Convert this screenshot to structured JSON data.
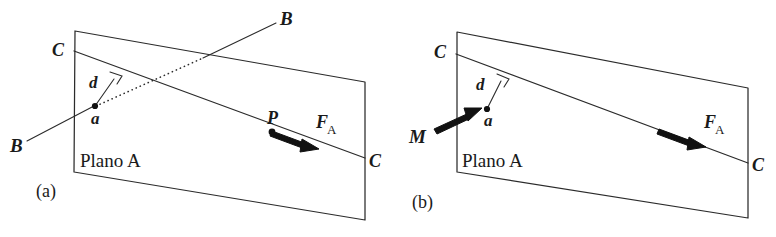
{
  "figure": {
    "caption_a": "(a)",
    "caption_b": "(b)",
    "background_color": "#ffffff",
    "line_color": "#2b2b2b",
    "vector_color": "#111111"
  },
  "panel_a": {
    "plane_label": "Plano A",
    "label_C_left": "C",
    "label_C_right": "C",
    "label_B_upper": "B",
    "label_B_lower": "B",
    "label_d": "d",
    "label_a": "a",
    "label_P": "P",
    "force_symbol": "F",
    "force_subscript": "A",
    "right_angle_marker": "perpendicular-mark"
  },
  "panel_b": {
    "plane_label": "Plano A",
    "label_C_left": "C",
    "label_C_right": "C",
    "label_d": "d",
    "label_a": "a",
    "moment_symbol": "M",
    "force_symbol": "F",
    "force_subscript": "A",
    "right_angle_marker": "perpendicular-mark"
  }
}
